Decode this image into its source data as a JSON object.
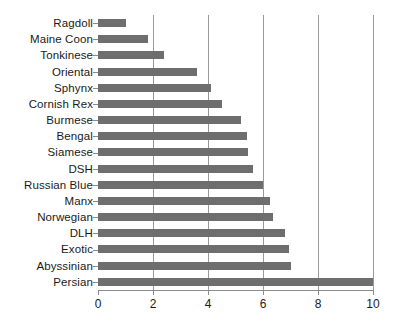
{
  "chart_data": {
    "type": "bar",
    "orientation": "horizontal",
    "title": "",
    "subtitle": "",
    "xlabel": "",
    "ylabel": "",
    "xlim": [
      0,
      10
    ],
    "xticks": [
      0,
      2,
      4,
      6,
      8,
      10
    ],
    "xtick_labels": [
      "0",
      "2",
      "4",
      "6",
      "8",
      "10"
    ],
    "grid": "vertical",
    "legend": "none",
    "bar_color": "#6e6e6e",
    "axis_color": "#8c8c8c",
    "gridline_color": "#9a9a9a",
    "text_color": "#1a1a1a",
    "background": "#ffffff",
    "categories": [
      "Ragdoll",
      "Maine Coon",
      "Tonkinese",
      "Oriental",
      "Sphynx",
      "Cornish Rex",
      "Burmese",
      "Bengal",
      "Siamese",
      "DSH",
      "Russian Blue",
      "Manx",
      "Norwegian",
      "DLH",
      "Exotic",
      "Abyssinian",
      "Persian"
    ],
    "values": [
      1.0,
      1.8,
      2.4,
      3.6,
      4.1,
      4.5,
      5.2,
      5.4,
      5.45,
      5.65,
      6.0,
      6.25,
      6.35,
      6.8,
      6.95,
      7.0,
      10.0
    ]
  }
}
